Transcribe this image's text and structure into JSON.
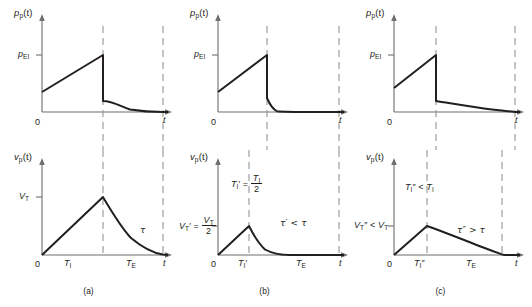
{
  "figure": {
    "panels": [
      {
        "caption": "(a)",
        "pressure": {
          "ylabel_main": "p",
          "ylabel_sub": "p",
          "ylabel_arg": "(t)",
          "ytick_main": "p",
          "ytick_sub": "EI",
          "xlabel": "t"
        },
        "volume": {
          "ylabel_main": "v",
          "ylabel_sub": "p",
          "ylabel_arg": "(t)",
          "ytick_main": "V",
          "ytick_sub": "T",
          "xlabel": "t",
          "origin": "0",
          "xtick1_main": "T",
          "xtick1_sub": "I",
          "xtick1_prime": "",
          "xtick2_main": "T",
          "xtick2_sub": "E",
          "tau_annotation": "τ"
        },
        "annotations": []
      },
      {
        "caption": "(b)",
        "pressure": {
          "ylabel_main": "p",
          "ylabel_sub": "p",
          "ylabel_arg": "(t)",
          "ytick_main": "p",
          "ytick_sub": "EI",
          "xlabel": "t"
        },
        "volume": {
          "ylabel_main": "v",
          "ylabel_sub": "p",
          "ylabel_arg": "(t)",
          "xlabel": "t",
          "origin": "0",
          "xtick1_main": "T",
          "xtick1_sub": "I",
          "xtick1_prime": "′",
          "xtick2_main": "T",
          "xtick2_sub": "E",
          "tau_annotation": "τ′ < τ"
        },
        "annotations": [
          {
            "name": "ti-prime-relation",
            "lhs_main": "T",
            "lhs_sub": "I",
            "lhs_prime": "′",
            "eq": "=",
            "num_main": "T",
            "num_sub": "I",
            "den": "2"
          },
          {
            "name": "vt-prime-relation",
            "lhs_main": "V",
            "lhs_sub": "T",
            "lhs_prime": "′",
            "eq": "=",
            "num_main": "V",
            "num_sub": "T",
            "den": "2"
          }
        ]
      },
      {
        "caption": "(c)",
        "pressure": {
          "ylabel_main": "p",
          "ylabel_sub": "p",
          "ylabel_arg": "(t)",
          "ytick_main": "p",
          "ytick_sub": "EI",
          "xlabel": "t"
        },
        "volume": {
          "ylabel_main": "v",
          "ylabel_sub": "p",
          "ylabel_arg": "(t)",
          "xlabel": "t",
          "origin": "0",
          "xtick1_main": "T",
          "xtick1_sub": "I",
          "xtick1_prime": "″",
          "xtick2_main": "T",
          "xtick2_sub": "E",
          "tau_annotation": "τ″ > τ"
        },
        "annotations": [
          {
            "name": "ti-doubleprime-relation",
            "text_lhs_main": "T",
            "text_lhs_sub": "I",
            "text_lhs_prime": "″",
            "rel": "<",
            "rhs_main": "T",
            "rhs_sub": "I"
          },
          {
            "name": "vt-doubleprime-relation",
            "text_lhs_main": "V",
            "text_lhs_sub": "T",
            "text_lhs_prime": "″",
            "rel": "<",
            "rhs_main": "V",
            "rhs_sub": "T"
          }
        ]
      }
    ],
    "colors": {
      "curve": "#231f20",
      "axis": "#6d6e71",
      "dashed": "#939598",
      "background": "#ffffff"
    }
  }
}
